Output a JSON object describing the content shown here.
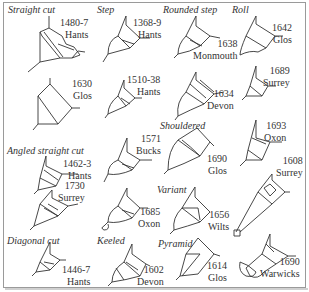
{
  "figure": {
    "categories": [
      {
        "id": "straight-cut",
        "label": "Straight cut",
        "x": 8,
        "y": 4
      },
      {
        "id": "step",
        "label": "Step",
        "x": 97,
        "y": 4
      },
      {
        "id": "rounded-step",
        "label": "Rounded step",
        "x": 163,
        "y": 4
      },
      {
        "id": "roll",
        "label": "Roll",
        "x": 232,
        "y": 4
      },
      {
        "id": "angled-straight-cut",
        "label": "Angled straight cut",
        "x": 7,
        "y": 145
      },
      {
        "id": "shouldered",
        "label": "Shouldered",
        "x": 160,
        "y": 120
      },
      {
        "id": "variant",
        "label": "Variant",
        "x": 157,
        "y": 184
      },
      {
        "id": "diagonal-cut",
        "label": "Diagonal cut",
        "x": 7,
        "y": 235
      },
      {
        "id": "keeled",
        "label": "Keeled",
        "x": 97,
        "y": 235
      },
      {
        "id": "pyramid",
        "label": "Pyramid",
        "x": 158,
        "y": 238
      }
    ],
    "examples": [
      {
        "id": "ex-1480",
        "date": "1480-7",
        "county": "Hants",
        "x": 40,
        "y": 17
      },
      {
        "id": "ex-1368",
        "date": "1368-9",
        "county": "Hants",
        "x": 108,
        "y": 17
      },
      {
        "id": "ex-1638",
        "date": "1638",
        "county": "Monmouth",
        "x": 195,
        "y": 41
      },
      {
        "id": "ex-1642",
        "date": "1642",
        "county": "Glos",
        "x": 253,
        "y": 22
      },
      {
        "id": "ex-1630",
        "date": "1630",
        "county": "Glos",
        "x": 58,
        "y": 78
      },
      {
        "id": "ex-1510",
        "date": "1510-38",
        "county": "Hants",
        "x": 110,
        "y": 74
      },
      {
        "id": "ex-1634",
        "date": "1634",
        "county": "Devon",
        "x": 205,
        "y": 88
      },
      {
        "id": "ex-1689",
        "date": "1689",
        "county": "Surrey",
        "x": 258,
        "y": 65
      },
      {
        "id": "ex-1462",
        "date": "1462-3",
        "county": "Hants",
        "x": 47,
        "y": 158
      },
      {
        "id": "ex-1571",
        "date": "1571",
        "county": "Bucks",
        "x": 120,
        "y": 133
      },
      {
        "id": "ex-1690g",
        "date": "1690",
        "county": "Glos",
        "x": 200,
        "y": 152
      },
      {
        "id": "ex-1693",
        "date": "1693",
        "county": "Oxon",
        "x": 262,
        "y": 120
      },
      {
        "id": "ex-1730",
        "date": "1730",
        "county": "Surrey",
        "x": 55,
        "y": 182
      },
      {
        "id": "ex-1685",
        "date": "1685",
        "county": "Oxon",
        "x": 110,
        "y": 206
      },
      {
        "id": "ex-1656",
        "date": "1656",
        "county": "Wilts",
        "x": 203,
        "y": 209
      },
      {
        "id": "ex-1608",
        "date": "1608",
        "county": "Surrey",
        "x": 270,
        "y": 155
      },
      {
        "id": "ex-1446",
        "date": "1446-7",
        "county": "Hants",
        "x": 50,
        "y": 264
      },
      {
        "id": "ex-1602",
        "date": "1602",
        "county": "Devon",
        "x": 114,
        "y": 264
      },
      {
        "id": "ex-1614",
        "date": "1614",
        "county": "Glos",
        "x": 204,
        "y": 260
      },
      {
        "id": "ex-1690w",
        "date": "1690",
        "county": "Warwicks",
        "x": 266,
        "y": 256
      }
    ]
  }
}
